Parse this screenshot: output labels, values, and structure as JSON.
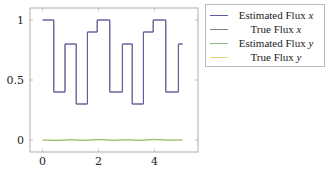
{
  "chart_data": {
    "type": "line",
    "title": "",
    "xlabel": "",
    "ylabel": "",
    "xlim": [
      -0.45,
      5.55
    ],
    "ylim": [
      -0.1,
      1.1
    ],
    "x_ticks": [
      0,
      2,
      4
    ],
    "y_ticks": [
      0,
      0.5,
      1
    ],
    "x_tick_labels": [
      "0",
      "2",
      "4"
    ],
    "y_tick_labels": [
      "0",
      "0.5",
      "1"
    ],
    "grid": false,
    "legend_position": "outside right top",
    "series": [
      {
        "name": "Estimated Flux x",
        "color": "#5b5ba6",
        "step": true,
        "x": [
          0,
          0.4,
          0.4,
          0.8,
          0.8,
          1.2,
          1.2,
          1.6,
          1.6,
          1.95,
          1.95,
          2.4,
          2.4,
          2.85,
          2.85,
          3.2,
          3.2,
          3.6,
          3.6,
          3.95,
          3.95,
          4.4,
          4.4,
          4.85,
          4.85,
          5.0
        ],
        "y": [
          1.0,
          1.0,
          0.4,
          0.4,
          0.8,
          0.8,
          0.3,
          0.3,
          0.9,
          0.9,
          1.0,
          1.0,
          0.4,
          0.4,
          0.8,
          0.8,
          0.3,
          0.3,
          0.9,
          0.9,
          1.0,
          1.0,
          0.4,
          0.4,
          0.8,
          0.8
        ]
      },
      {
        "name": "True Flux x",
        "color": "#808080",
        "step": true,
        "x": [
          0,
          0.4,
          0.4,
          0.8,
          0.8,
          1.2,
          1.2,
          1.6,
          1.6,
          1.95,
          1.95,
          2.4,
          2.4,
          2.85,
          2.85,
          3.2,
          3.2,
          3.6,
          3.6,
          3.95,
          3.95,
          4.4,
          4.4,
          4.85,
          4.85,
          5.0
        ],
        "y": [
          1.0,
          1.0,
          0.4,
          0.4,
          0.8,
          0.8,
          0.3,
          0.3,
          0.9,
          0.9,
          1.0,
          1.0,
          0.4,
          0.4,
          0.8,
          0.8,
          0.3,
          0.3,
          0.9,
          0.9,
          1.0,
          1.0,
          0.4,
          0.4,
          0.8,
          0.8
        ]
      },
      {
        "name": "Estimated Flux y",
        "color": "#7cc27c",
        "x": [
          0,
          0.5,
          1.0,
          1.5,
          2.0,
          2.5,
          3.0,
          3.5,
          4.0,
          4.5,
          5.0
        ],
        "y": [
          0.0,
          -0.005,
          0.003,
          -0.004,
          0.006,
          -0.003,
          0.002,
          -0.004,
          0.007,
          -0.002,
          0.0
        ]
      },
      {
        "name": "True Flux y",
        "color": "#e6d27a",
        "x": [
          0,
          5.0
        ],
        "y": [
          0.0,
          0.0
        ]
      }
    ]
  },
  "legend": {
    "items": [
      {
        "label": "Estimated Flux ",
        "var": "x",
        "color": "#5b5ba6"
      },
      {
        "label": "True Flux ",
        "var": "x",
        "color": "#808080"
      },
      {
        "label": "Estimated Flux ",
        "var": "y",
        "color": "#7cc27c"
      },
      {
        "label": "True Flux ",
        "var": "y",
        "color": "#e6d27a"
      }
    ]
  }
}
